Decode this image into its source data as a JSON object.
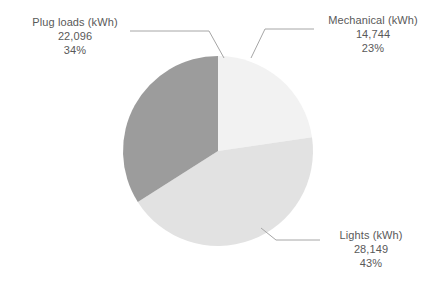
{
  "chart_data": {
    "type": "pie",
    "title": "",
    "categories": [
      "Mechanical (kWh)",
      "Lights (kWh)",
      "Plug loads (kWh)"
    ],
    "values": [
      14744,
      28149,
      22096
    ],
    "value_labels": [
      "14,744",
      "28,149",
      "22,096"
    ],
    "percentages": [
      23,
      43,
      34
    ],
    "percent_labels": [
      "23%",
      "43%",
      "34%"
    ],
    "slices": [
      {
        "label": "Mechanical (kWh)",
        "value": 14744,
        "value_label": "14,744",
        "percent": 23,
        "percent_label": "23%",
        "color": "#f2f2f2"
      },
      {
        "label": "Lights (kWh)",
        "value": 28149,
        "value_label": "28,149",
        "percent": 43,
        "percent_label": "43%",
        "color": "#e2e2e2"
      },
      {
        "label": "Plug loads (kWh)",
        "value": 22096,
        "value_label": "22,096",
        "percent": 34,
        "percent_label": "34%",
        "color": "#9c9c9c"
      }
    ],
    "legend": "none",
    "labels_position": "outside-callout",
    "start_angle_deg": 0,
    "direction": "clockwise",
    "grid": false,
    "background_color": "#ffffff",
    "label_text_color": "#595959",
    "leader_line_color": "#a6a6a6"
  }
}
